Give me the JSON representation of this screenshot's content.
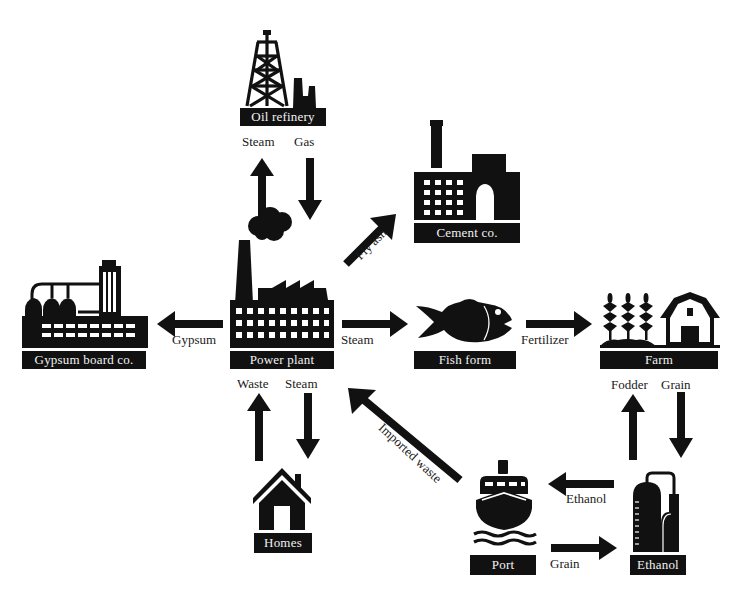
{
  "diagram": {
    "type": "industrial-symbiosis-flow",
    "nodes": {
      "oil_refinery": {
        "label": "Oil refinery"
      },
      "cement": {
        "label": "Cement co."
      },
      "gypsum": {
        "label": "Gypsum board co."
      },
      "power_plant": {
        "label": "Power plant"
      },
      "fish": {
        "label": "Fish form"
      },
      "farm": {
        "label": "Farm"
      },
      "homes": {
        "label": "Homes"
      },
      "port": {
        "label": "Port"
      },
      "ethanol": {
        "label": "Ethanol"
      }
    },
    "flows": {
      "pp_to_refinery": {
        "label": "Steam",
        "from": "Power plant",
        "to": "Oil refinery"
      },
      "refinery_to_pp": {
        "label": "Gas",
        "from": "Oil refinery",
        "to": "Power plant"
      },
      "pp_to_cement": {
        "label": "Fly ash",
        "from": "Power plant",
        "to": "Cement co."
      },
      "pp_to_gypsum": {
        "label": "Gypsum",
        "from": "Power plant",
        "to": "Gypsum board co."
      },
      "pp_to_fish": {
        "label": "Steam",
        "from": "Power plant",
        "to": "Fish form"
      },
      "fish_to_farm": {
        "label": "Fertilizer",
        "from": "Fish form",
        "to": "Farm"
      },
      "homes_to_pp": {
        "label": "Waste",
        "from": "Homes",
        "to": "Power plant"
      },
      "pp_to_homes": {
        "label": "Steam",
        "from": "Power plant",
        "to": "Homes"
      },
      "port_to_pp": {
        "label": "Imported waste",
        "from": "Port",
        "to": "Power plant"
      },
      "ethanol_to_farm": {
        "label": "Fodder",
        "from": "Ethanol",
        "to": "Farm"
      },
      "farm_to_ethanol": {
        "label": "Grain",
        "from": "Farm",
        "to": "Ethanol"
      },
      "ethanol_to_port": {
        "label": "Ethanol",
        "from": "Ethanol",
        "to": "Port"
      },
      "port_to_ethanol": {
        "label": "Grain",
        "from": "Port",
        "to": "Ethanol"
      }
    },
    "colors": {
      "ink": "#111111",
      "label_text": "#f2f2f2",
      "background": "#ffffff"
    }
  }
}
